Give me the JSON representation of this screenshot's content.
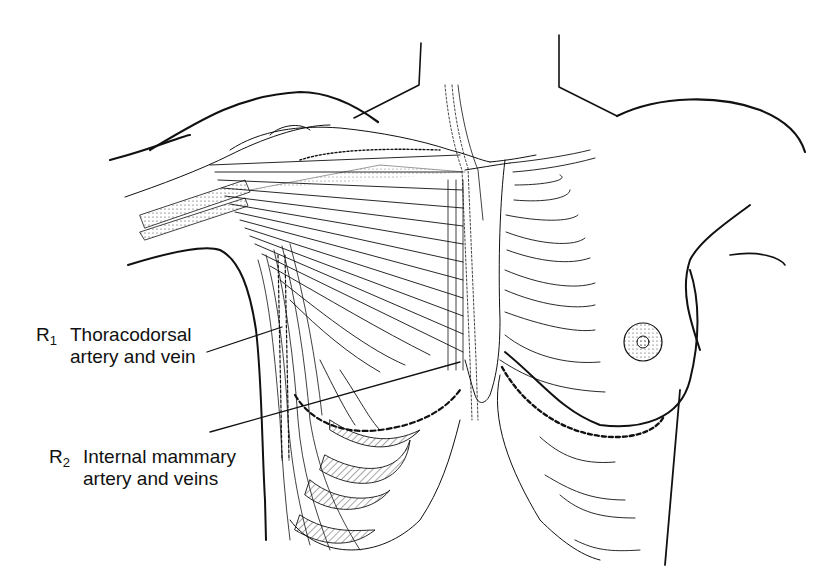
{
  "figure": {
    "colors": {
      "ink": "#111111",
      "background": "#ffffff"
    }
  },
  "labels": [
    {
      "id": "R1",
      "prefix": "R",
      "subscript": "1",
      "line1": "Thoracodorsal",
      "line2": "artery and vein"
    },
    {
      "id": "R2",
      "prefix": "R",
      "subscript": "2",
      "line1": "Internal mammary",
      "line2": "artery and veins"
    }
  ]
}
